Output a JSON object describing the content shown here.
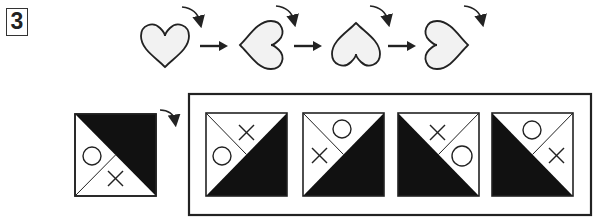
{
  "problem": {
    "number": "3",
    "rule_sequence": {
      "description": "Heart rotated 90 degrees clockwise at each step",
      "hearts": [
        {
          "rotation_deg": 0
        },
        {
          "rotation_deg": 90
        },
        {
          "rotation_deg": 180
        },
        {
          "rotation_deg": 270
        }
      ],
      "rotation_direction": "clockwise",
      "arrows": 3
    },
    "question_figure": {
      "shaded_triangle": "top-right",
      "divider": "bottom-left to center",
      "symbols": {
        "circle": "left",
        "cross": "bottom"
      }
    },
    "answer_choices": [
      {
        "shaded_triangle": "bottom-right",
        "divider": "top-left to center",
        "symbols": {
          "circle": "left",
          "cross": "top"
        }
      },
      {
        "shaded_triangle": "bottom-right",
        "divider": "top-left to center",
        "symbols": {
          "circle": "top",
          "cross": "left"
        }
      },
      {
        "shaded_triangle": "bottom-left",
        "divider": "top-right to center",
        "symbols": {
          "circle": "right",
          "cross": "top"
        }
      },
      {
        "shaded_triangle": "bottom-left",
        "divider": "top-right to center",
        "symbols": {
          "circle": "top",
          "cross": "right"
        }
      }
    ],
    "colors": {
      "stroke": "#222222",
      "fill_dark": "#111111",
      "heart_fill": "#f2f2f2"
    }
  }
}
